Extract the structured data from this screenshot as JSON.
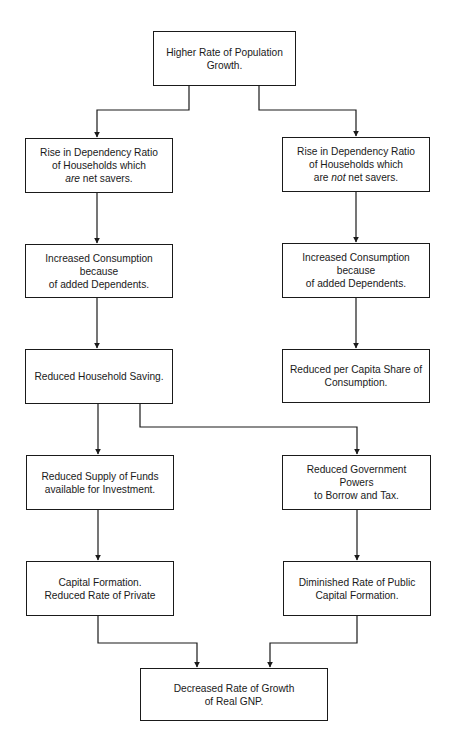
{
  "diagram": {
    "nodes": {
      "n1": {
        "label_pre": "Higher Rate of Population\nGrowth.",
        "emph": "",
        "label_post": ""
      },
      "n2": {
        "label_pre": "Rise in Dependency Ratio\nof Households which\n",
        "emph": "are",
        "label_post": " net savers."
      },
      "n3": {
        "label_pre": "Rise in Dependency Ratio\nof Households which\nare ",
        "emph": "not",
        "label_post": " net savers."
      },
      "n4": {
        "label_pre": "Increased Consumption\nbecause\nof added Dependents.",
        "emph": "",
        "label_post": ""
      },
      "n5": {
        "label_pre": "Increased Consumption\nbecause\nof added Dependents.",
        "emph": "",
        "label_post": ""
      },
      "n6": {
        "label_pre": "Reduced Household Saving.",
        "emph": "",
        "label_post": ""
      },
      "n7": {
        "label_pre": "Reduced per Capita Share of\nConsumption.",
        "emph": "",
        "label_post": ""
      },
      "n8": {
        "label_pre": "Reduced Supply of Funds\navailable for Investment.",
        "emph": "",
        "label_post": ""
      },
      "n9": {
        "label_pre": "Reduced Government Powers\nto Borrow and Tax.",
        "emph": "",
        "label_post": ""
      },
      "n10": {
        "label_pre": "Capital Formation.\nReduced Rate of Private",
        "emph": "",
        "label_post": ""
      },
      "n11": {
        "label_pre": "Diminished Rate of Public\nCapital Formation.",
        "emph": "",
        "label_post": ""
      },
      "n12": {
        "label_pre": "Decreased Rate of Growth\nof Real GNP.",
        "emph": "",
        "label_post": ""
      }
    },
    "edges": [
      {
        "from": "n1",
        "to": "n2"
      },
      {
        "from": "n1",
        "to": "n3"
      },
      {
        "from": "n2",
        "to": "n4"
      },
      {
        "from": "n3",
        "to": "n5"
      },
      {
        "from": "n4",
        "to": "n6"
      },
      {
        "from": "n5",
        "to": "n7"
      },
      {
        "from": "n6",
        "to": "n8"
      },
      {
        "from": "n6",
        "to": "n9"
      },
      {
        "from": "n8",
        "to": "n10"
      },
      {
        "from": "n9",
        "to": "n11"
      },
      {
        "from": "n10",
        "to": "n12"
      },
      {
        "from": "n11",
        "to": "n12"
      }
    ],
    "colors": {
      "line": "#1a1a1a",
      "background": "#ffffff"
    }
  }
}
